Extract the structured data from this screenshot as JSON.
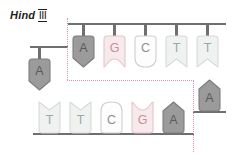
{
  "enzyme": {
    "name": "Hind",
    "numeral": "III"
  },
  "colors": {
    "gray_fill": "#9b9b9b",
    "gray_stroke": "#7d7d7d",
    "gray_text": "#5a5a5a",
    "pink_fill": "#f7eaec",
    "pink_stroke": "#e9c3c9",
    "pink_text": "#c98f97",
    "white_fill": "#fdfdfd",
    "white_stroke": "#cfcfcf",
    "white_text": "#8f8f8f",
    "pale_fill": "#eff2f1",
    "pale_stroke": "#d5dbd9",
    "pale_text": "#9aa6a2",
    "backbone": "#6f6f6f",
    "cutline": "#e4909b",
    "label_text": "#1d1d1d"
  },
  "top_strand": {
    "label": "top-strand",
    "left_fragment": [
      {
        "letter": "A",
        "shape": "point-down",
        "style": "gray",
        "x": 28,
        "stem_top": 47,
        "stem_height": 12,
        "base_y": 58
      }
    ],
    "right_fragment": [
      {
        "letter": "A",
        "shape": "point-down",
        "style": "gray",
        "x": 72,
        "stem_top": 24,
        "stem_height": 12,
        "base_y": 35
      },
      {
        "letter": "G",
        "shape": "notch-down",
        "style": "pink",
        "x": 103,
        "stem_top": 24,
        "stem_height": 12,
        "base_y": 35
      },
      {
        "letter": "C",
        "shape": "round-down",
        "style": "white",
        "x": 134,
        "stem_top": 24,
        "stem_height": 12,
        "base_y": 35
      },
      {
        "letter": "T",
        "shape": "vee-down",
        "style": "pale",
        "x": 165,
        "stem_top": 24,
        "stem_height": 12,
        "base_y": 35
      },
      {
        "letter": "T",
        "shape": "vee-down",
        "style": "pale",
        "x": 196,
        "stem_top": 24,
        "stem_height": 12,
        "base_y": 35
      }
    ]
  },
  "bottom_strand": {
    "label": "bottom-strand",
    "left_fragment": [
      {
        "letter": "T",
        "shape": "vee-up",
        "style": "pale",
        "x": 38,
        "stem_top": 134,
        "stem_height": 12,
        "base_y": 101
      },
      {
        "letter": "T",
        "shape": "vee-up",
        "style": "pale",
        "x": 69,
        "stem_top": 134,
        "stem_height": 12,
        "base_y": 101
      },
      {
        "letter": "C",
        "shape": "round-up",
        "style": "white",
        "x": 100,
        "stem_top": 134,
        "stem_height": 12,
        "base_y": 101
      },
      {
        "letter": "G",
        "shape": "notch-up",
        "style": "pink",
        "x": 131,
        "stem_top": 134,
        "stem_height": 12,
        "base_y": 101
      },
      {
        "letter": "A",
        "shape": "point-up",
        "style": "gray",
        "x": 162,
        "stem_top": 134,
        "stem_height": 12,
        "base_y": 101
      }
    ],
    "right_fragment": [
      {
        "letter": "A",
        "shape": "point-up",
        "style": "gray",
        "x": 198,
        "stem_top": 112,
        "stem_height": 12,
        "base_y": 79
      }
    ]
  },
  "backbones": [
    {
      "name": "top-backbone-left",
      "x": 30,
      "y": 46,
      "width": 38
    },
    {
      "name": "top-backbone-right",
      "x": 68,
      "y": 23,
      "width": 158
    },
    {
      "name": "bottom-backbone-left",
      "x": 33,
      "y": 133,
      "width": 161
    },
    {
      "name": "bottom-backbone-right",
      "x": 193,
      "y": 111,
      "width": 33
    }
  ],
  "cutlines": [
    {
      "name": "cut-vertical-left",
      "orient": "v",
      "x": 67,
      "y": 18,
      "length": 62
    },
    {
      "name": "cut-horizontal",
      "orient": "h",
      "x": 67,
      "y": 80,
      "length": 127
    },
    {
      "name": "cut-vertical-right",
      "orient": "v",
      "x": 193,
      "y": 80,
      "length": 72
    }
  ],
  "sequence": {
    "top": "A | A G C T T",
    "bottom": "T T C G A | A",
    "recognition_site": "AAGCTT",
    "cut_type": "staggered / sticky ends"
  }
}
